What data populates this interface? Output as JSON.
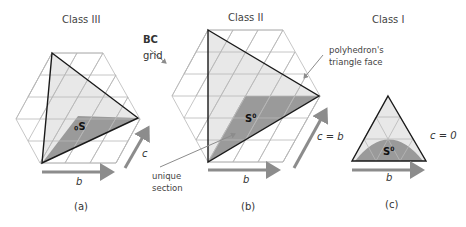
{
  "panels": [
    {
      "id": "a",
      "title": "Class III",
      "caption": "(a)",
      "axis_b_label": "b",
      "axis_c_label": "c",
      "unique_section_label": "S",
      "unique_section_sup": "0"
    },
    {
      "id": "b",
      "title": "Class II",
      "caption": "(b)",
      "axis_b_label": "b",
      "axis_c_label": "c = b",
      "unique_section_label": "S",
      "unique_section_sup": "0"
    },
    {
      "id": "c",
      "title": "Class I",
      "caption": "(c)",
      "axis_b_label": "b",
      "axis_c_label": "c = 0",
      "unique_section_label": "S",
      "unique_section_sup": "0"
    }
  ],
  "annotations": {
    "bc_grid_bold": "BC",
    "bc_grid_text": "grid",
    "unique_section_line1": "unique",
    "unique_section_line2": "section",
    "face_line1": "polyhedron's",
    "face_line2": "triangle face"
  },
  "colors": {
    "grid": "#b8b8b8",
    "face_fill": "#e6e6e6",
    "section_fill": "#9a9a9a",
    "edge": "#1a1a1a",
    "arrow": "#8c8c8c"
  }
}
